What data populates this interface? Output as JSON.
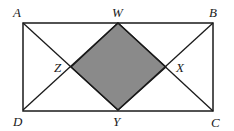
{
  "diagram": {
    "points": {
      "A": {
        "x": 23,
        "y": 23
      },
      "B": {
        "x": 213,
        "y": 23
      },
      "C": {
        "x": 213,
        "y": 111
      },
      "D": {
        "x": 23,
        "y": 110
      },
      "W": {
        "x": 118,
        "y": 23
      },
      "X": {
        "x": 166,
        "y": 67
      },
      "Y": {
        "x": 118,
        "y": 110
      },
      "Z": {
        "x": 71,
        "y": 67
      }
    },
    "labels": {
      "A": "A",
      "B": "B",
      "C": "C",
      "D": "D",
      "W": "W",
      "X": "X",
      "Y": "Y",
      "Z": "Z"
    },
    "segments": [
      [
        "A",
        "B"
      ],
      [
        "B",
        "C"
      ],
      [
        "C",
        "D"
      ],
      [
        "D",
        "A"
      ],
      [
        "A",
        "Y"
      ],
      [
        "D",
        "W"
      ],
      [
        "W",
        "C"
      ],
      [
        "B",
        "Y"
      ]
    ],
    "shaded_region": [
      "W",
      "X",
      "Y",
      "Z"
    ],
    "colors": {
      "stroke": "#1a1a1a",
      "shade": "#8a8a8a",
      "background": "#ffffff"
    }
  }
}
